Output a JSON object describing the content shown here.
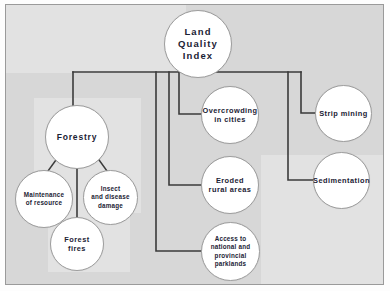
{
  "diagram": {
    "title": "Land Quality Index",
    "type": "concept-map",
    "canvas": {
      "background_color": "#d7d7d7",
      "panel_color": "#e2e2e2",
      "border_color": "#9a9a9a"
    },
    "style": {
      "node_fill": "#ffffff",
      "node_stroke": "#9d9d9d",
      "text_color": "#1b2234",
      "connector_color": "#3b3b3b"
    },
    "nodes": [
      {
        "id": "root",
        "label": "Land Quality Index",
        "lines": [
          "Land",
          "Quality",
          "Index"
        ]
      },
      {
        "id": "forestry",
        "label": "Forestry",
        "lines": [
          "Forestry"
        ]
      },
      {
        "id": "overcrowding",
        "label": "Overcrowding in cities",
        "lines": [
          "Overcrowding",
          "in cities"
        ]
      },
      {
        "id": "strip-mining",
        "label": "Strip mining",
        "lines": [
          "Strip mining"
        ]
      },
      {
        "id": "eroded",
        "label": "Eroded rural areas",
        "lines": [
          "Eroded",
          "rural areas"
        ]
      },
      {
        "id": "sedimentation",
        "label": "Sedimentation",
        "lines": [
          "Sedimentation"
        ]
      },
      {
        "id": "access",
        "label": "Access to national and provincial parklands",
        "lines": [
          "Access to",
          "national and",
          "provincial",
          "parklands"
        ]
      },
      {
        "id": "maintenance",
        "label": "Maintenance of resource",
        "lines": [
          "Maintenance",
          "of resource"
        ]
      },
      {
        "id": "insect",
        "label": "Insect and disease damage",
        "lines": [
          "Insect",
          "and disease",
          "damage"
        ]
      },
      {
        "id": "forest-fires",
        "label": "Forest fires",
        "lines": [
          "Forest",
          "fires"
        ]
      }
    ],
    "edges": [
      {
        "from": "root",
        "to": "forestry"
      },
      {
        "from": "root",
        "to": "overcrowding"
      },
      {
        "from": "root",
        "to": "strip-mining"
      },
      {
        "from": "root",
        "to": "eroded"
      },
      {
        "from": "root",
        "to": "sedimentation"
      },
      {
        "from": "root",
        "to": "access"
      },
      {
        "from": "forestry",
        "to": "maintenance"
      },
      {
        "from": "forestry",
        "to": "insect"
      },
      {
        "from": "forestry",
        "to": "forest-fires"
      }
    ]
  }
}
